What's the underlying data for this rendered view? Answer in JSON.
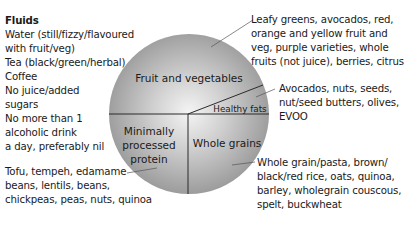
{
  "fluids": {
    "title": "Fluids",
    "lines": [
      "Water (still/fizzy/flavoured",
      "with fruit/veg)",
      "Tea (black/green/herbal)",
      "Coffee",
      "No juice/added",
      "sugars",
      "No more than 1",
      "alcoholic drink",
      "a day, preferably nil"
    ]
  },
  "plate": {
    "segments": [
      {
        "id": "fruit-veg",
        "label": "Fruit and vegetables"
      },
      {
        "id": "healthy-fats",
        "label": "Healthy fats"
      },
      {
        "id": "protein",
        "label_lines": [
          "Minimally",
          "processed",
          "protein"
        ]
      },
      {
        "id": "whole-grains",
        "label": "Whole grains"
      }
    ],
    "colors": {
      "fill_light": "#f2f2f2",
      "fill_dark": "#9a9a9a",
      "divider": "#2b2b2b"
    }
  },
  "callouts": {
    "fruit_veg": [
      "Leafy greens, avocados, red,",
      "orange and yellow fruit and",
      "veg, purple varieties, whole",
      "fruits (not juice), berries, citrus"
    ],
    "healthy_fats": [
      "Avocados, nuts, seeds,",
      "nut/seed butters, olives,",
      "EVOO"
    ],
    "whole_grains": [
      "Whole grain/pasta, brown/",
      "black/red rice, oats, quinoa,",
      "barley, wholegrain couscous,",
      "spelt, buckwheat"
    ],
    "protein": [
      "Tofu, tempeh, edamame",
      "beans, lentils, beans,",
      "chickpeas, peas, nuts, quinoa"
    ]
  }
}
